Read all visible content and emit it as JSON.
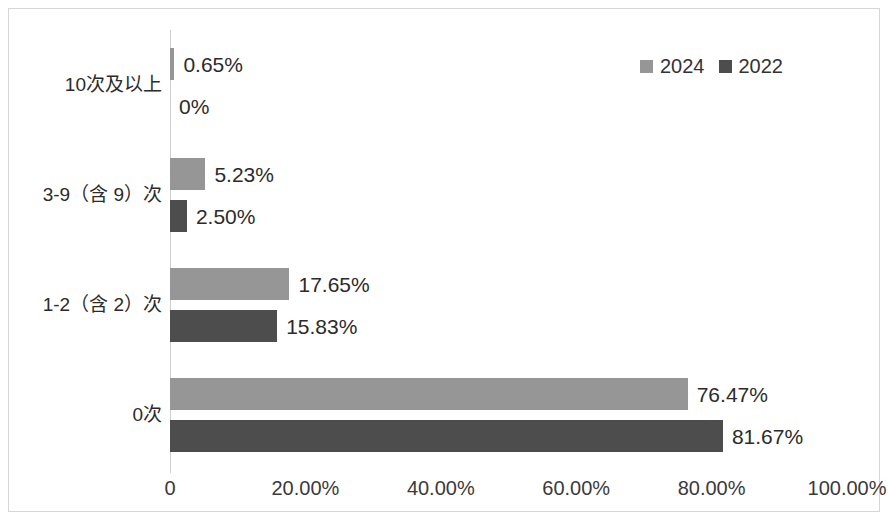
{
  "chart_data": {
    "type": "bar",
    "orientation": "horizontal",
    "title": "",
    "subtitle": "",
    "xlabel": "",
    "ylabel": "",
    "xlim": [
      0,
      100
    ],
    "grid": false,
    "legend_position": "top-right",
    "categories": [
      "10次及以上",
      "3-9（含 9）次",
      "1-2（含 2）次",
      "0次"
    ],
    "series": [
      {
        "name": "2024",
        "color": "#969696",
        "values": [
          0.65,
          5.23,
          17.65,
          76.47
        ],
        "labels": [
          "0.65%",
          "5.23%",
          "17.65%",
          "76.47%"
        ]
      },
      {
        "name": "2022",
        "color": "#4d4d4d",
        "values": [
          0,
          2.5,
          15.83,
          81.67
        ],
        "labels": [
          "0%",
          "2.50%",
          "15.83%",
          "81.67%"
        ]
      }
    ],
    "xticks": [
      {
        "value": 0,
        "label": "0"
      },
      {
        "value": 20,
        "label": "20.00%"
      },
      {
        "value": 40,
        "label": "40.00%"
      },
      {
        "value": 60,
        "label": "60.00%"
      },
      {
        "value": 80,
        "label": "80.00%"
      },
      {
        "value": 100,
        "label": "100.00%"
      }
    ]
  },
  "legend": {
    "entries": [
      {
        "label": "2024",
        "color": "#969696"
      },
      {
        "label": "2022",
        "color": "#4d4d4d"
      }
    ]
  },
  "colors": {
    "series_2024": "#969696",
    "series_2022": "#4d4d4d",
    "axis": "#cfcfcf",
    "frame": "#d6d6d6",
    "text": "#2b2b2b"
  }
}
